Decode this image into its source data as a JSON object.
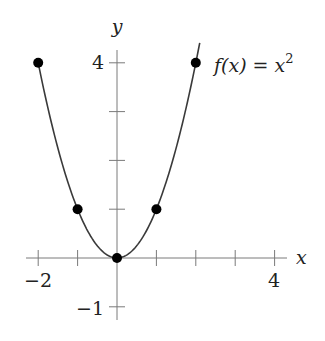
{
  "chart_data": {
    "type": "line",
    "title": "",
    "function_label": "f(x) = x²",
    "function_label_parts": {
      "lhs": "f(x) = x",
      "exponent": "2"
    },
    "xlabel": "x",
    "ylabel": "y",
    "xlim": [
      -2.2,
      4.4
    ],
    "ylim": [
      -1.2,
      4.3
    ],
    "x_ticks": [
      -2,
      -1,
      0,
      1,
      2,
      3,
      4
    ],
    "x_tick_labels": [
      {
        "value": -2,
        "label": "−2"
      },
      {
        "value": 4,
        "label": "4"
      }
    ],
    "y_ticks": [
      -1,
      1,
      2,
      3,
      4
    ],
    "y_tick_labels": [
      {
        "value": 4,
        "label": "4"
      },
      {
        "value": -1,
        "label": "−1"
      }
    ],
    "grid": false,
    "legend": "none",
    "series": [
      {
        "name": "f(x) = x^2",
        "kind": "curve",
        "x_range": [
          -2,
          2.1
        ],
        "color": "#3a3a3a"
      },
      {
        "name": "marked points",
        "kind": "scatter",
        "x": [
          -2,
          -1,
          0,
          1,
          2
        ],
        "y": [
          4,
          1,
          0,
          1,
          4
        ],
        "color": "#000000"
      }
    ]
  },
  "colors": {
    "axis": "#7a7a7a",
    "curve": "#3a3a3a",
    "points": "#000000",
    "background": "#ffffff"
  }
}
